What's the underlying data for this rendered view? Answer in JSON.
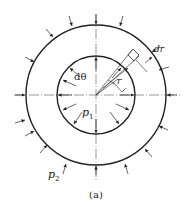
{
  "figure": {
    "caption": "(a)",
    "labels": {
      "dtheta": "dθ",
      "dr": "dr",
      "r": "r",
      "p1_base": "p",
      "p1_sub": "1",
      "p2_base": "p",
      "p2_sub": "2"
    },
    "geometry": {
      "center": [
        96,
        95
      ],
      "inner_radius": 39,
      "outer_radius": 70
    },
    "colors": {
      "stroke": "#222222",
      "background": "#ffffff"
    }
  }
}
